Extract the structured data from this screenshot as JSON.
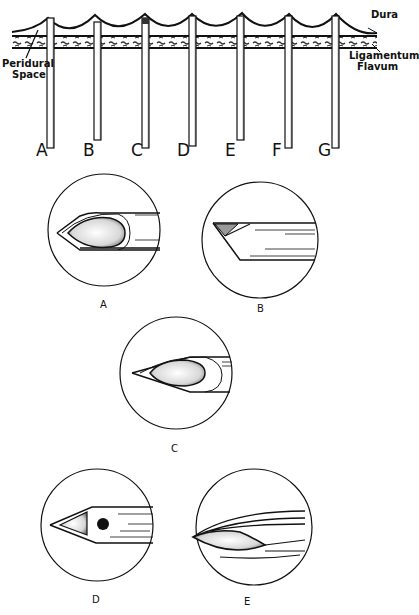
{
  "top_figure": {
    "labels": {
      "dura": "Dura",
      "ligamentum_flavum": [
        "Ligamentum",
        "Flavum"
      ],
      "peridural_space": [
        "Peridural",
        "Space"
      ]
    },
    "needles": [
      {
        "id": "A",
        "label": "A"
      },
      {
        "id": "B",
        "label": "B"
      },
      {
        "id": "C",
        "label": "C"
      },
      {
        "id": "D",
        "label": "D"
      },
      {
        "id": "E",
        "label": "E"
      },
      {
        "id": "F",
        "label": "F"
      },
      {
        "id": "G",
        "label": "G"
      }
    ]
  },
  "tip_details": [
    {
      "id": "A",
      "label": "A"
    },
    {
      "id": "B",
      "label": "B"
    },
    {
      "id": "C",
      "label": "C"
    },
    {
      "id": "D",
      "label": "D"
    },
    {
      "id": "E",
      "label": "E"
    }
  ],
  "colors": {
    "ink": "#111111",
    "background": "#ffffff",
    "shading": "#9a9a9a"
  }
}
